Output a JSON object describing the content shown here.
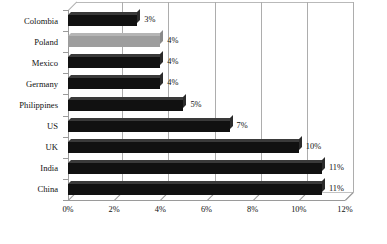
{
  "chart": {
    "type": "bar",
    "orientation": "horizontal",
    "title": "",
    "xlabel": "",
    "ylabel": "",
    "highlight_color": "#9d9d9d",
    "bar_color": "#111111",
    "grid": true,
    "legend": "none"
  },
  "chart_data": {
    "type": "bar",
    "orientation": "horizontal",
    "title": "",
    "xlabel": "",
    "ylabel": "",
    "xlim": [
      0,
      12
    ],
    "xticks": [
      0,
      2,
      4,
      6,
      8,
      10,
      12
    ],
    "xticklabels": [
      "0%",
      "2%",
      "4%",
      "6%",
      "8%",
      "10%",
      "12%"
    ],
    "grid": true,
    "legend_position": "none",
    "categories": [
      "Colombia",
      "Poland",
      "Mexico",
      "Germany",
      "Philippines",
      "US",
      "UK",
      "India",
      "China"
    ],
    "values": [
      3,
      4,
      4,
      4,
      5,
      7,
      10,
      11,
      11
    ],
    "datalabels": [
      "3%",
      "4%",
      "4%",
      "4%",
      "5%",
      "7%",
      "10%",
      "11%",
      "11%"
    ],
    "highlighted_categories": [
      "Poland"
    ],
    "bar_colors": [
      "#111111",
      "#9d9d9d",
      "#111111",
      "#111111",
      "#111111",
      "#111111",
      "#111111",
      "#111111",
      "#111111"
    ]
  }
}
